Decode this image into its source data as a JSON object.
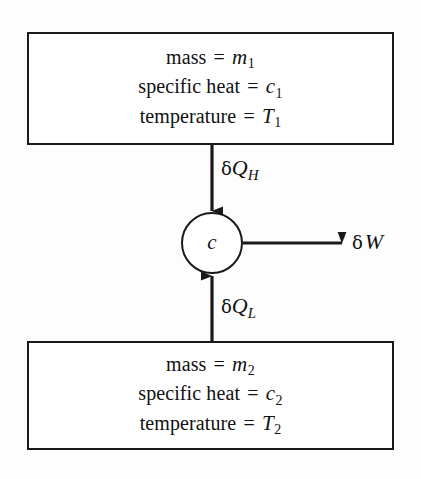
{
  "diagram": {
    "colors": {
      "background": "#fdfdfd",
      "stroke": "#1a1a1a",
      "fill": "#ffffff",
      "text": "#111111"
    },
    "hot_reservoir": {
      "name": "hot-reservoir",
      "lines": [
        {
          "label": "mass",
          "equals": "=",
          "variable": "m",
          "subscript": "1"
        },
        {
          "label": "specific heat",
          "equals": "=",
          "variable": "c",
          "subscript": "1"
        },
        {
          "label": "temperature",
          "equals": "=",
          "variable": "T",
          "subscript": "1"
        }
      ]
    },
    "cold_reservoir": {
      "name": "cold-reservoir",
      "lines": [
        {
          "label": "mass",
          "equals": "=",
          "variable": "m",
          "subscript": "2"
        },
        {
          "label": "specific heat",
          "equals": "=",
          "variable": "c",
          "subscript": "2"
        },
        {
          "label": "temperature",
          "equals": "=",
          "variable": "T",
          "subscript": "2"
        }
      ]
    },
    "engine": {
      "name": "engine-node",
      "label": "c"
    },
    "flows": [
      {
        "name": "heat-in-high",
        "delta": "δ",
        "variable": "Q",
        "subscript": "H",
        "direction": "down",
        "from": "hot-reservoir",
        "to": "engine-node"
      },
      {
        "name": "heat-in-low",
        "delta": "δ",
        "variable": "Q",
        "subscript": "L",
        "direction": "up",
        "from": "cold-reservoir",
        "to": "engine-node"
      },
      {
        "name": "work-out",
        "delta": "δ",
        "variable": "W",
        "subscript": "",
        "direction": "right",
        "from": "engine-node",
        "to": "surroundings"
      }
    ]
  }
}
